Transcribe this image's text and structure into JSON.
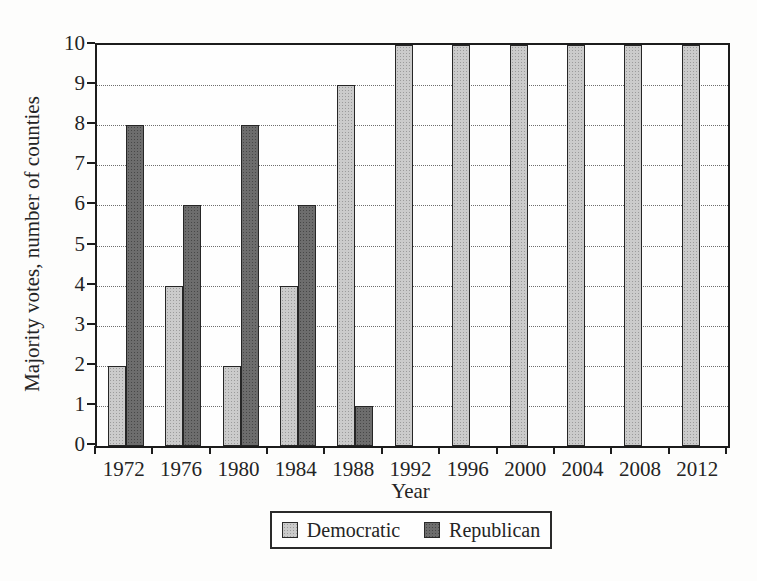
{
  "chart_data": {
    "type": "bar",
    "title": "",
    "xlabel": "Year",
    "ylabel": "Majority votes, number of counties",
    "categories": [
      "1972",
      "1976",
      "1980",
      "1984",
      "1988",
      "1992",
      "1996",
      "2000",
      "2004",
      "2008",
      "2012"
    ],
    "series": [
      {
        "name": "Democratic",
        "color": "#cbcbcb",
        "texture_dot_color": "#9b9b9b",
        "values": [
          2,
          4,
          2,
          4,
          9,
          10,
          10,
          10,
          10,
          10,
          10
        ]
      },
      {
        "name": "Republican",
        "color": "#6d6d6d",
        "texture_dot_color": "#474747",
        "values": [
          8,
          6,
          8,
          6,
          1,
          0,
          0,
          0,
          0,
          0,
          0
        ]
      }
    ],
    "ylim": [
      0,
      10
    ],
    "ytick_step": 1,
    "yticks": [
      0,
      1,
      2,
      3,
      4,
      5,
      6,
      7,
      8,
      9,
      10
    ],
    "grid": "horizontal-dotted",
    "legend_position": "bottom-center",
    "axis_color": "#1c1c1c"
  }
}
